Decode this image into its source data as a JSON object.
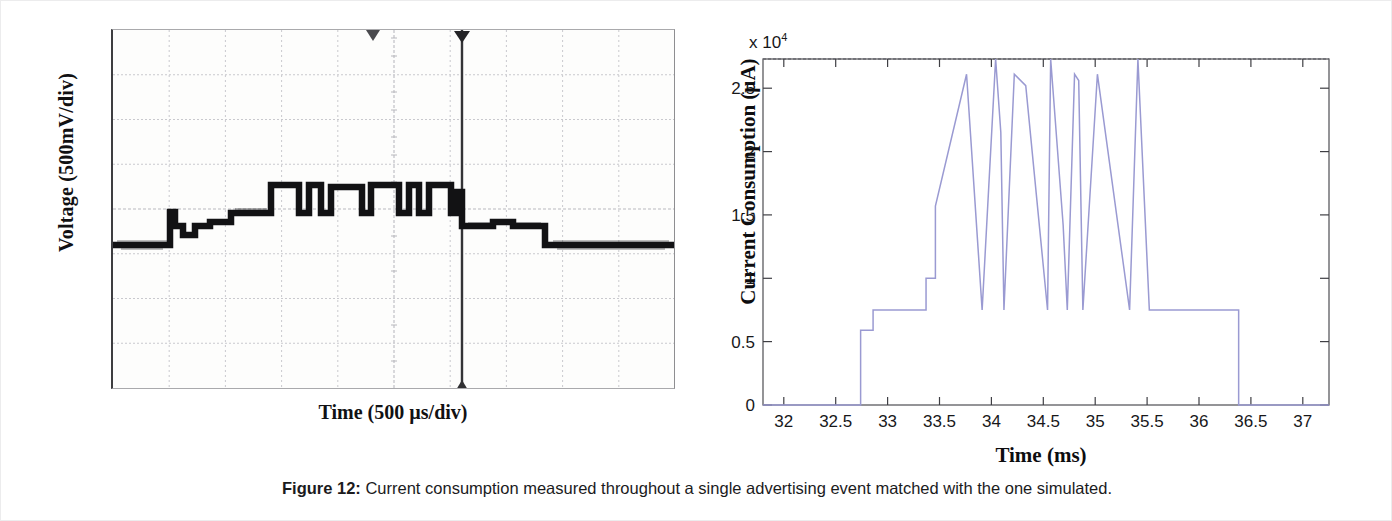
{
  "figure": {
    "caption_label": "Figure 12:",
    "caption_text": "Current consumption measured throughout a single advertising event matched with the one simulated."
  },
  "left_panel": {
    "name": "oscilloscope-capture",
    "ylabel": "Voltage (500mV/div)",
    "xlabel": "Time (500 µs/div)",
    "grid_divisions_x": 10,
    "grid_divisions_y": 8,
    "trace_color": "#131315",
    "grid_color": "#cfcfd2"
  },
  "chart_data": {
    "type": "line",
    "title": "",
    "xlabel": "Time (ms)",
    "ylabel": "Current Consumption (µA)",
    "y_exponent_label": "x 10⁴",
    "y_exponent": 10000,
    "line_color": "#9a9ad2",
    "grid": false,
    "legend": null,
    "xlim": [
      31.8,
      37.25
    ],
    "ylim": [
      0,
      27300
    ],
    "xticks": [
      32,
      32.5,
      33,
      33.5,
      34,
      34.5,
      35,
      35.5,
      36,
      36.5,
      37
    ],
    "xtick_labels": [
      "32",
      "32.5",
      "33",
      "33.5",
      "34",
      "34.5",
      "35",
      "35.5",
      "36",
      "36.5",
      "37"
    ],
    "yticks": [
      0,
      5000,
      10000,
      15000,
      20000,
      25000
    ],
    "ytick_labels": [
      "0",
      "0.5",
      "1",
      "1.5",
      "2",
      "2.5"
    ],
    "series": [
      {
        "name": "Measured current consumption",
        "step": "post",
        "x": [
          31.8,
          32.74,
          32.74,
          32.86,
          32.86,
          33.37,
          33.37,
          33.46,
          33.46,
          33.76,
          33.76,
          33.91,
          33.91,
          34.04,
          34.04,
          34.09,
          34.09,
          34.12,
          34.12,
          34.22,
          34.22,
          34.33,
          34.33,
          34.54,
          34.54,
          34.57,
          34.57,
          34.69,
          34.69,
          34.73,
          34.73,
          34.8,
          34.8,
          34.84,
          34.84,
          34.88,
          34.88,
          35.02,
          35.02,
          35.33,
          35.33,
          35.41,
          35.41,
          35.52,
          35.52,
          36.38,
          36.38,
          37.25
        ],
        "y": [
          0,
          0,
          5900,
          5900,
          7500,
          7500,
          10000,
          10000,
          15700,
          26100,
          26100,
          7500,
          7500,
          27300,
          27300,
          21500,
          21500,
          7500,
          7500,
          26100,
          26100,
          25200,
          25200,
          7500,
          7500,
          27300,
          27300,
          14200,
          14200,
          7500,
          7500,
          26100,
          26100,
          25600,
          25600,
          7500,
          7500,
          26100,
          26100,
          7500,
          7500,
          27300,
          27300,
          7500,
          7500,
          7500,
          0,
          0
        ]
      }
    ],
    "annotations": [
      {
        "text": "baseline idle current",
        "value": 0
      },
      {
        "text": "pre-advertising ramp levels",
        "values": [
          5900,
          7500,
          10000
        ]
      },
      {
        "text": "radio TX/RX bursts",
        "value": 26100
      },
      {
        "text": "peak bursts",
        "value": 27300
      }
    ]
  }
}
